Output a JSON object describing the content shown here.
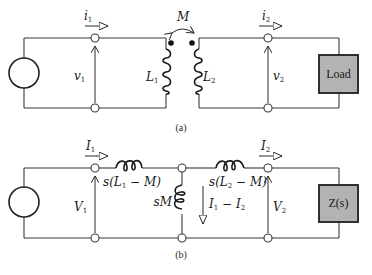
{
  "figure": {
    "panel_a": {
      "caption": "(a)",
      "mutual_inductance": "M",
      "primary": {
        "current": "i",
        "current_sub": "1",
        "voltage": "v",
        "voltage_sub": "1",
        "inductor": "L",
        "inductor_sub": "1"
      },
      "secondary": {
        "current": "i",
        "current_sub": "2",
        "voltage": "v",
        "voltage_sub": "2",
        "inductor": "L",
        "inductor_sub": "2"
      },
      "load_label": "Load"
    },
    "panel_b": {
      "caption": "(b)",
      "primary": {
        "current": "I",
        "current_sub": "1",
        "voltage": "V",
        "voltage_sub": "1",
        "series_impedance_pre": "s(L",
        "series_impedance_sub": "1",
        "series_impedance_post": " − M)"
      },
      "shunt": {
        "impedance": "sM",
        "current_a": "I",
        "current_a_sub": "1",
        "current_mid": " − ",
        "current_b": "I",
        "current_b_sub": "2"
      },
      "secondary": {
        "current": "I",
        "current_sub": "2",
        "voltage": "V",
        "voltage_sub": "2",
        "series_impedance_pre": "s(L",
        "series_impedance_sub": "2",
        "series_impedance_post": " − M)"
      },
      "load_label": "Z(s)"
    },
    "colors": {
      "load_fill": "#b3b3b3",
      "wire": "#3a3a3a"
    }
  }
}
